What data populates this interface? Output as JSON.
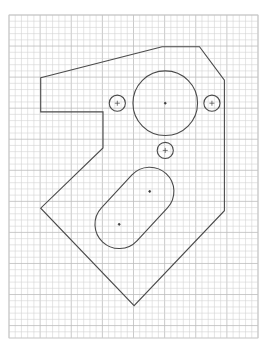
{
  "drawing": {
    "title": "",
    "background": "#ffffff",
    "grid": {
      "columns": 40,
      "rows": 52,
      "major_every": 5,
      "minor_color": "#d4d4d4",
      "major_color": "#bdbdbd"
    },
    "line_color": "#4a4a4a",
    "units": "grid cells",
    "outline": {
      "name": "part-outline",
      "vertices": [
        [
          5.1,
          10.1
        ],
        [
          24.6,
          5.1
        ],
        [
          30.6,
          5.1
        ],
        [
          34.6,
          10.5
        ],
        [
          34.6,
          31.5
        ],
        [
          20.1,
          46.8
        ],
        [
          5.1,
          31.1
        ],
        [
          15.1,
          21.4
        ],
        [
          15.1,
          15.6
        ],
        [
          5.1,
          15.6
        ]
      ]
    },
    "circles": [
      {
        "name": "large-bore",
        "cx": 25.1,
        "cy": 14.2,
        "r": 5.2,
        "center_mark": "dot"
      },
      {
        "name": "hole-left",
        "cx": 17.4,
        "cy": 14.2,
        "r": 1.3,
        "center_mark": "cross"
      },
      {
        "name": "hole-right",
        "cx": 32.6,
        "cy": 14.2,
        "r": 1.3,
        "center_mark": "cross"
      },
      {
        "name": "hole-bottom",
        "cx": 25.1,
        "cy": 21.8,
        "r": 1.3,
        "center_mark": "cross"
      }
    ],
    "slot": {
      "name": "oblong-slot",
      "c1": [
        22.6,
        28.4
      ],
      "c2": [
        17.7,
        33.7
      ],
      "r": 3.9
    }
  }
}
